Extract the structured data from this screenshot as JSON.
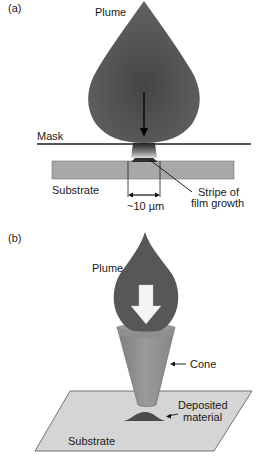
{
  "panel_a": {
    "label": "(a)",
    "plume_label": "Plume",
    "mask_label": "Mask",
    "substrate_label": "Substrate",
    "stripe_label_line1": "Stripe of",
    "stripe_label_line2": "film growth",
    "dimension_label": "~10 µm"
  },
  "panel_b": {
    "label": "(b)",
    "plume_label": "Plume",
    "cone_label": "Cone",
    "deposited_label_line1": "Deposited",
    "deposited_label_line2": "material",
    "substrate_label": "Substrate"
  },
  "colors": {
    "plume": "#5a5a5a",
    "plume_dark": "#3c3c3c",
    "mask": "#555555",
    "substrate_a": "#a9a9a9",
    "cone": "#8d8d8d",
    "substrate_b": "#d6d6d6",
    "deposit": "#4a4a4a",
    "line": "#111111"
  }
}
